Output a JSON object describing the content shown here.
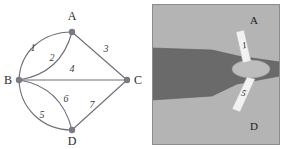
{
  "figure": {
    "background": "#ffffff"
  },
  "graph": {
    "name": "bridge-multigraph",
    "colors": {
      "edge": "#6e6e78",
      "vertex": "#7a7a84",
      "label": "#2b2b2b"
    },
    "vertices": [
      {
        "id": "A",
        "label": "A",
        "x": 72,
        "y": 32,
        "label_x": 72,
        "label_y": 20
      },
      {
        "id": "B",
        "label": "B",
        "x": 19,
        "y": 80,
        "label_x": 8,
        "label_y": 84
      },
      {
        "id": "C",
        "label": "C",
        "x": 127,
        "y": 80,
        "label_x": 138,
        "label_y": 84
      },
      {
        "id": "D",
        "label": "D",
        "x": 72,
        "y": 130,
        "label_x": 72,
        "label_y": 145
      }
    ],
    "edges": [
      {
        "id": "e1",
        "label": "1",
        "from": "B",
        "to": "A",
        "shape": "curve-outer",
        "label_x": 33,
        "label_y": 51
      },
      {
        "id": "e2",
        "label": "2",
        "from": "B",
        "to": "A",
        "shape": "curve-inner",
        "label_x": 52,
        "label_y": 61
      },
      {
        "id": "e3",
        "label": "3",
        "from": "A",
        "to": "C",
        "shape": "straight",
        "label_x": 106,
        "label_y": 52
      },
      {
        "id": "e4",
        "label": "4",
        "from": "B",
        "to": "C",
        "shape": "straight",
        "label_x": 72,
        "label_y": 72
      },
      {
        "id": "e5",
        "label": "5",
        "from": "B",
        "to": "D",
        "shape": "curve-outer",
        "label_x": 42,
        "label_y": 118
      },
      {
        "id": "e6",
        "label": "6",
        "from": "B",
        "to": "D",
        "shape": "curve-inner",
        "label_x": 66,
        "label_y": 102
      },
      {
        "id": "e7",
        "label": "7",
        "from": "D",
        "to": "C",
        "shape": "straight",
        "label_x": 92,
        "label_y": 108
      }
    ]
  },
  "map": {
    "name": "river-bridge-map",
    "colors": {
      "land": "#b4b4b4",
      "water": "#6a6a6a",
      "bridge": "#f2f2f2",
      "border": "#8c8c8c",
      "island": "#bdbdbd"
    },
    "regions": [
      {
        "id": "A",
        "label": "A",
        "label_x": 102,
        "label_y": 20
      },
      {
        "id": "D",
        "label": "D",
        "label_x": 102,
        "label_y": 126
      }
    ],
    "bridges": [
      {
        "id": "b1",
        "label": "1",
        "label_x": 93,
        "label_y": 44
      },
      {
        "id": "b5",
        "label": "5",
        "label_x": 91,
        "label_y": 92
      }
    ]
  }
}
